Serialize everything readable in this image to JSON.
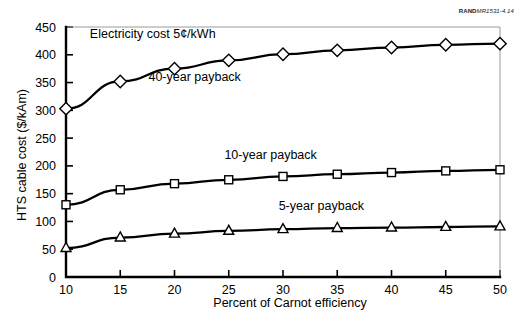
{
  "credit": {
    "prefix": "RAND",
    "code": "MR1531-4.14"
  },
  "chart_data": {
    "type": "line",
    "title": "",
    "subtitle": "",
    "xlabel": "Percent of Carnot efficiency",
    "ylabel": "HTS cable cost ($/kAm)",
    "xlim": [
      10,
      50
    ],
    "ylim": [
      0,
      450
    ],
    "xticks": [
      10,
      15,
      20,
      25,
      30,
      35,
      40,
      45,
      50
    ],
    "xtick_labels": [
      "10",
      "15",
      "20",
      "25",
      "30",
      "35",
      "40",
      "45",
      "50"
    ],
    "yticks": [
      0,
      50,
      100,
      150,
      200,
      250,
      300,
      350,
      400,
      450
    ],
    "ytick_labels": [
      "0",
      "50",
      "100",
      "150",
      "200",
      "250",
      "300",
      "350",
      "400",
      "450"
    ],
    "grid": false,
    "legend_position": "inline-annotations",
    "x": [
      10,
      15,
      20,
      25,
      30,
      35,
      40,
      45,
      50
    ],
    "series": [
      {
        "name": "40-year payback",
        "marker": "diamond",
        "values": [
          303,
          352,
          375,
          390,
          401,
          408,
          413,
          418,
          420
        ]
      },
      {
        "name": "10-year payback",
        "marker": "square",
        "values": [
          130,
          157,
          168,
          175,
          181,
          185,
          188,
          191,
          193
        ]
      },
      {
        "name": "5-year payback",
        "marker": "triangle",
        "values": [
          52,
          71,
          78,
          83,
          86,
          88,
          89,
          90,
          91
        ]
      }
    ],
    "annotations": [
      {
        "text": "Electricity cost 5¢/kWh",
        "x": 12.2,
        "y": 430
      },
      {
        "text": "40-year payback",
        "x": 17.6,
        "y": 352
      },
      {
        "text": "10-year payback",
        "x": 24.6,
        "y": 212
      },
      {
        "text": "5-year payback",
        "x": 29.6,
        "y": 120
      }
    ]
  },
  "colors": {
    "line": "#000000",
    "marker_fill": "#ffffff",
    "axis": "#000000",
    "frame": "#9a9a9a",
    "background": "#ffffff"
  }
}
